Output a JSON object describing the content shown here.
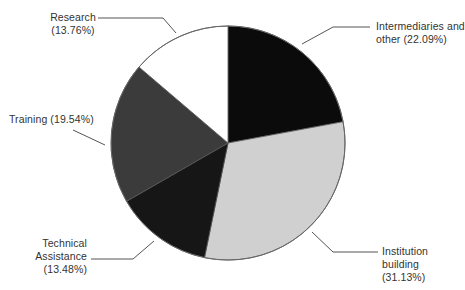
{
  "chart_data": {
    "type": "pie",
    "title": "",
    "start_angle_deg": 0,
    "direction": "clockwise",
    "slices": [
      {
        "label": "Intermediaries and other",
        "value": 22.09,
        "display": "Intermediaries and other (22.09%)",
        "color": "#0b0b0b"
      },
      {
        "label": "Institution building",
        "value": 31.13,
        "display": "Institution building (31.13%)",
        "color": "#d0d0d0"
      },
      {
        "label": "Technical Assistance",
        "value": 13.48,
        "display": "Technical Assistance (13.48%)",
        "color": "#161616"
      },
      {
        "label": "Training",
        "value": 19.54,
        "display": "Training (19.54%)",
        "color": "#3b3b3b"
      },
      {
        "label": "Research",
        "value": 13.76,
        "display": "Research (13.76%)",
        "color": "#ffffff"
      }
    ],
    "legend": "none (direct labels with leader lines)"
  },
  "labels": {
    "intermediaries": {
      "line1": "Intermediaries and",
      "line2": "other (22.09%)"
    },
    "institution": {
      "line1": "Institution",
      "line2": "building",
      "line3": "(31.13%)"
    },
    "technical": {
      "line1": "Technical",
      "line2": "Assistance",
      "line3": "(13.48%)"
    },
    "training": {
      "line1": "Training (19.54%)"
    },
    "research": {
      "line1": "Research",
      "line2": "(13.76%)"
    }
  }
}
